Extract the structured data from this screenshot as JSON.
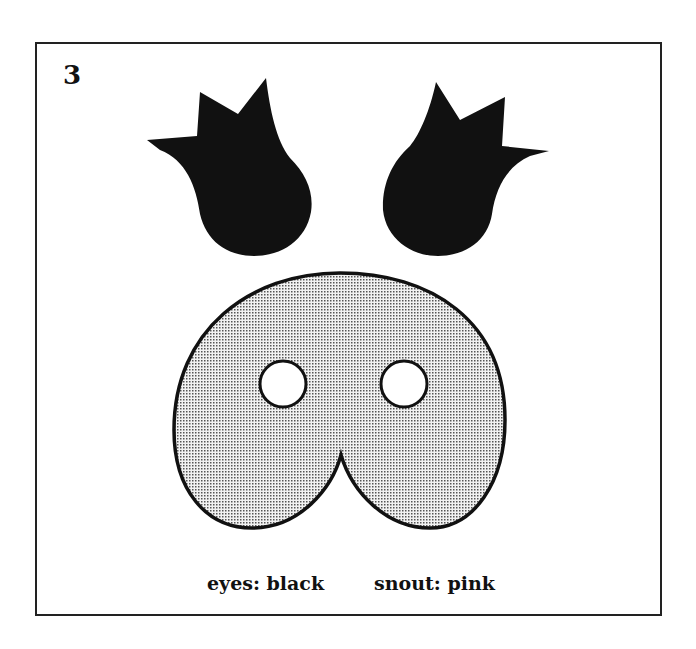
{
  "template": {
    "number": "3",
    "pieces": [
      {
        "id": "left-eye",
        "color_name": "black"
      },
      {
        "id": "right-eye",
        "color_name": "black"
      },
      {
        "id": "snout",
        "color_name": "pink",
        "nostrils": 2
      }
    ],
    "labels": {
      "eyes": "eyes: black",
      "snout": "snout: pink"
    },
    "colors": {
      "eyes": "#111111",
      "snout_fill": "#d8d8d8",
      "outline": "#111111"
    }
  }
}
